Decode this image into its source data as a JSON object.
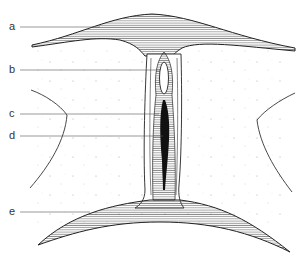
{
  "diagram": {
    "labels": [
      {
        "key": "a",
        "text": "a"
      },
      {
        "key": "b",
        "text": "b"
      },
      {
        "key": "c",
        "text": "c"
      },
      {
        "key": "d",
        "text": "d"
      },
      {
        "key": "e",
        "text": "e"
      }
    ],
    "colors": {
      "line": "#222222",
      "hatch": "#444444",
      "fill_dark": "#111111",
      "background": "#ffffff",
      "leader": "#555555"
    }
  }
}
